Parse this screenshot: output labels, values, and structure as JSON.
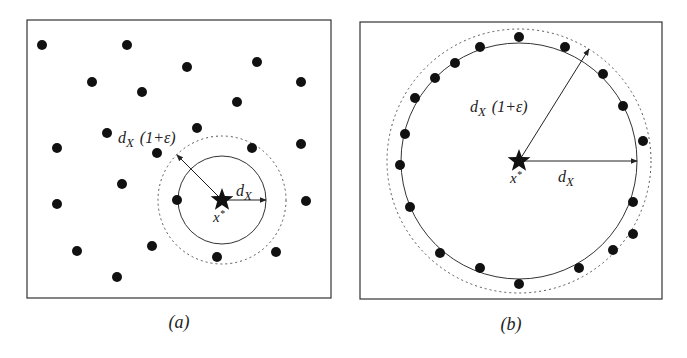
{
  "panels": [
    {
      "id": "a",
      "caption": "(a)",
      "frame": {
        "x": 27,
        "y": 20,
        "w": 304,
        "h": 278
      },
      "center": {
        "x": 222,
        "y": 200
      },
      "inner_radius": 44,
      "outer_radius": 64,
      "center_label": "x*",
      "inner_label": "d_X",
      "outer_label": "d_X (1+ε)",
      "points": [
        [
          42,
          45
        ],
        [
          127,
          45
        ],
        [
          187,
          67
        ],
        [
          257,
          62
        ],
        [
          301,
          82
        ],
        [
          92,
          82
        ],
        [
          142,
          92
        ],
        [
          237,
          102
        ],
        [
          197,
          128
        ],
        [
          107,
          133
        ],
        [
          57,
          148
        ],
        [
          157,
          153
        ],
        [
          252,
          148
        ],
        [
          301,
          144
        ],
        [
          122,
          184
        ],
        [
          57,
          204
        ],
        [
          177,
          200
        ],
        [
          306,
          201
        ],
        [
          77,
          251
        ],
        [
          152,
          246
        ],
        [
          217,
          257
        ],
        [
          276,
          252
        ],
        [
          117,
          277
        ]
      ]
    },
    {
      "id": "b",
      "caption": "(b)",
      "frame": {
        "x": 360,
        "y": 22,
        "w": 302,
        "h": 277
      },
      "center": {
        "x": 519,
        "y": 161
      },
      "inner_radius": 118,
      "outer_radius": 132,
      "center_label": "x*",
      "inner_label": "d_X",
      "outer_label": "d_X (1+ε)",
      "points": [
        [
          519,
          37
        ],
        [
          480,
          47
        ],
        [
          565,
          47
        ],
        [
          455,
          63
        ],
        [
          435,
          78
        ],
        [
          603,
          74
        ],
        [
          415,
          98
        ],
        [
          623,
          106
        ],
        [
          405,
          134
        ],
        [
          643,
          141
        ],
        [
          400,
          165
        ],
        [
          410,
          207
        ],
        [
          633,
          202
        ],
        [
          633,
          234
        ],
        [
          440,
          253
        ],
        [
          613,
          250
        ],
        [
          480,
          268
        ],
        [
          579,
          268
        ],
        [
          519,
          284
        ]
      ]
    }
  ],
  "text": {
    "caption_a": "(a)",
    "caption_b": "(b)",
    "x_star": "x",
    "star_sup": "*",
    "d": "d",
    "sub_x": "X",
    "factor": "(1+ε)"
  }
}
